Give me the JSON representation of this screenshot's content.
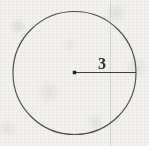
{
  "figure": {
    "kind": "geometry-diagram",
    "background_color": "#f3f2f0",
    "ink_color": "#4a4a4a",
    "label_color": "#2e2e2e",
    "circle": {
      "center_x": 74.5,
      "center_y": 73,
      "radius": 61.5,
      "stroke_width": 1.15,
      "stroke_color": "#4e4e4e"
    },
    "center_point": {
      "x": 74.5,
      "y": 72.5,
      "size": 3.4,
      "color": "#1f1f1f"
    },
    "radius_segment": {
      "x1": 75,
      "y1": 72.5,
      "x2": 136,
      "y2": 72.5,
      "stroke_width": 1.15,
      "stroke_color": "#3c3c3c"
    },
    "radius_label": {
      "text": "3",
      "x": 98,
      "y": 56,
      "font_size": 16
    },
    "scan_artifact_line": {
      "x": 110,
      "color": "#969694"
    }
  },
  "chart_data": {
    "type": "diagram",
    "title": "",
    "shapes": [
      {
        "shape": "circle",
        "center": [
          74.5,
          73
        ],
        "radius_px": 61.5,
        "labeled_radius_value": "3"
      },
      {
        "shape": "point",
        "role": "center",
        "position": [
          74.5,
          72.5
        ]
      },
      {
        "shape": "segment",
        "role": "radius",
        "from": [
          75,
          72.5
        ],
        "to": [
          136,
          72.5
        ],
        "label": "3"
      }
    ],
    "annotations": [
      "3"
    ]
  }
}
